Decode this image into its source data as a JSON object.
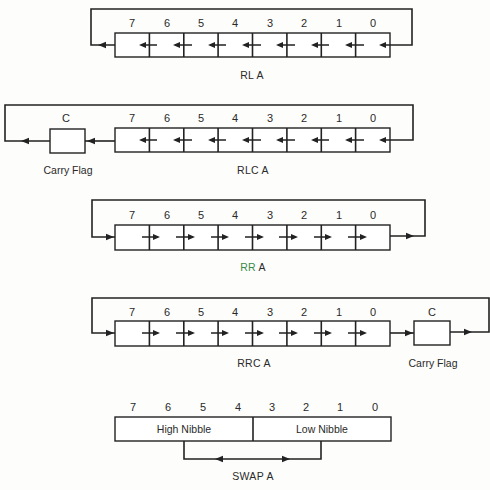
{
  "diagrams": [
    {
      "id": "rla",
      "caption": "RL A",
      "direction": "left",
      "bits": [
        "7",
        "6",
        "5",
        "4",
        "3",
        "2",
        "1",
        "0"
      ],
      "carry": null
    },
    {
      "id": "rlca",
      "caption": "RLC A",
      "direction": "left",
      "bits": [
        "7",
        "6",
        "5",
        "4",
        "3",
        "2",
        "1",
        "0"
      ],
      "carry": {
        "label": "C",
        "caption": "Carry Flag",
        "position": "left"
      }
    },
    {
      "id": "rra",
      "caption": "RR A",
      "caption_colors": {
        "RR": "#3a8a4a",
        "A": "#2a2a2a"
      },
      "direction": "right",
      "bits": [
        "7",
        "6",
        "5",
        "4",
        "3",
        "2",
        "1",
        "0"
      ],
      "carry": null
    },
    {
      "id": "rrca",
      "caption": "RRC A",
      "direction": "right",
      "bits": [
        "7",
        "6",
        "5",
        "4",
        "3",
        "2",
        "1",
        "0"
      ],
      "carry": {
        "label": "C",
        "caption": "Carry Flag",
        "position": "right"
      }
    },
    {
      "id": "swap",
      "caption": "SWAP A",
      "bits": [
        "7",
        "6",
        "5",
        "4",
        "3",
        "2",
        "1",
        "0"
      ],
      "high_nibble": "High Nibble",
      "low_nibble": "Low Nibble"
    }
  ],
  "colors": {
    "line": "#222222",
    "text": "#2a2a2a",
    "background": "#fdfdfb"
  }
}
